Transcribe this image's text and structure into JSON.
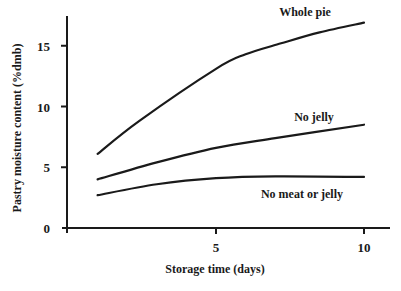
{
  "chart_data": {
    "type": "line",
    "title": "",
    "xlabel": "Storage time (days)",
    "ylabel": "Pastry moisture content (%dmb)",
    "xlim": [
      0,
      11
    ],
    "ylim": [
      0,
      17.5
    ],
    "xticks": [
      5,
      10
    ],
    "yticks": [
      0,
      5,
      10,
      15
    ],
    "grid": false,
    "legend": "inline labels",
    "series": [
      {
        "name": "Whole pie",
        "x": [
          1,
          2.4,
          5,
          6,
          7.2,
          8.5,
          10
        ],
        "values": [
          6.1,
          8.8,
          13.1,
          14.3,
          15.2,
          16.1,
          16.9
        ],
        "label_pos": [
          305,
          16
        ]
      },
      {
        "name": "No jelly",
        "x": [
          1,
          3,
          5,
          7,
          10
        ],
        "values": [
          4.0,
          5.4,
          6.6,
          7.4,
          8.5
        ],
        "label_pos": [
          314,
          121
        ]
      },
      {
        "name": "No meat or jelly",
        "x": [
          1,
          3,
          5,
          7,
          10
        ],
        "values": [
          2.7,
          3.6,
          4.1,
          4.25,
          4.2
        ],
        "label_pos": [
          302,
          198
        ]
      }
    ]
  }
}
